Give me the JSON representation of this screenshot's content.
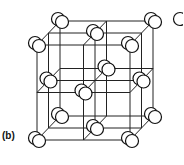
{
  "figure": {
    "label": "(b)",
    "line_color": "#222222",
    "atom_fill": "#ffffff",
    "atom_stroke": "#111111"
  }
}
